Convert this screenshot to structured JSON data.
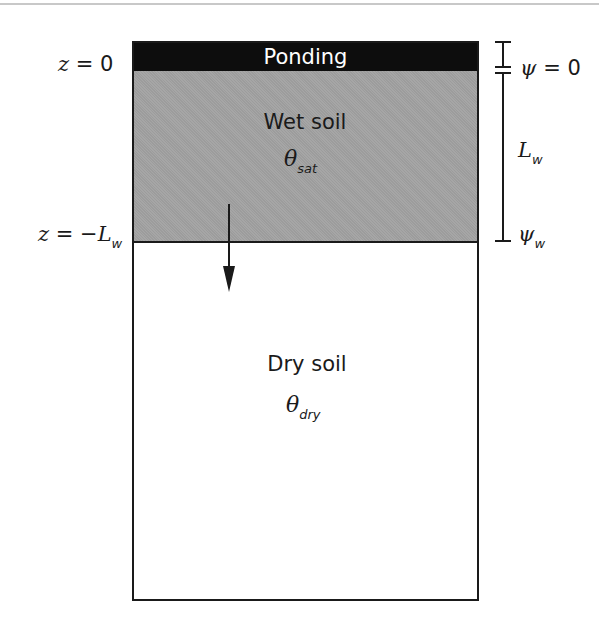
{
  "diagram": {
    "type": "soil infiltration (Green-Ampt) schematic",
    "layers": {
      "ponding": {
        "label": "Ponding",
        "color": "#0d0d0d"
      },
      "wet": {
        "label": "Wet soil",
        "symbol": "θ",
        "subscript": "sat",
        "color": "#a6a6a6"
      },
      "dry": {
        "label": "Dry soil",
        "symbol": "θ",
        "subscript": "dry",
        "color": "#ffffff"
      }
    },
    "left_labels": {
      "surface": {
        "var": "z",
        "eq": " = 0"
      },
      "front": {
        "var": "z",
        "eq": " = −",
        "var2": "L",
        "subscript": "w"
      }
    },
    "right_labels": {
      "top": {
        "var": "ψ",
        "eq": " = 0"
      },
      "length": {
        "var": "L",
        "subscript": "w"
      },
      "bottom": {
        "var": "ψ",
        "subscript": "w"
      }
    },
    "arrow": {
      "direction": "down",
      "meaning": "wetting front advance"
    }
  }
}
